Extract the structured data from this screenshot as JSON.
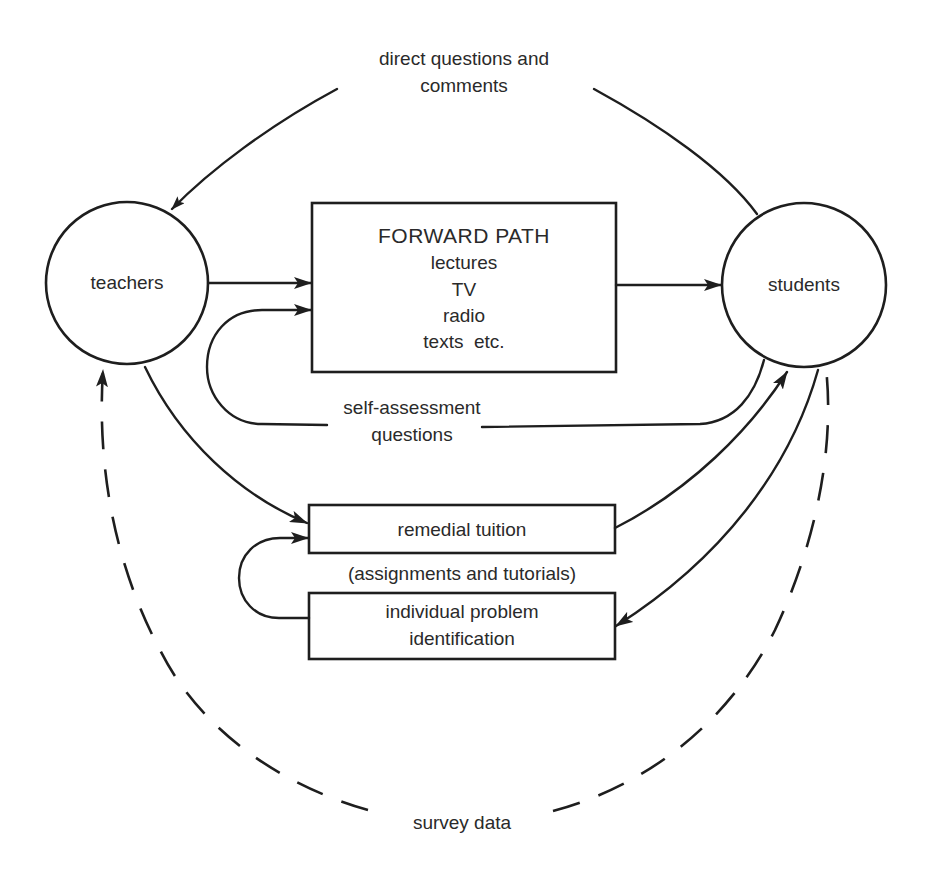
{
  "diagram": {
    "nodes": {
      "teachers": {
        "label": "teachers",
        "shape": "circle"
      },
      "students": {
        "label": "students",
        "shape": "circle"
      },
      "forward_path": {
        "title": "FORWARD PATH",
        "items": [
          "lectures",
          "TV",
          "radio",
          "texts  etc."
        ]
      },
      "remedial_tuition": {
        "label": "remedial tuition"
      },
      "individual_problem": {
        "lines": [
          "individual problem",
          "identification"
        ]
      }
    },
    "edge_labels": {
      "direct_questions": [
        "direct questions and",
        "comments"
      ],
      "self_assessment": [
        "self-assessment",
        "questions"
      ],
      "assignments": "(assignments and tutorials)",
      "survey_data": "survey data"
    },
    "edges": [
      {
        "from": "students",
        "to": "teachers",
        "label": "direct questions and comments",
        "style": "solid"
      },
      {
        "from": "teachers",
        "to": "forward_path",
        "style": "solid"
      },
      {
        "from": "forward_path",
        "to": "students",
        "style": "solid"
      },
      {
        "from": "students",
        "to": "forward_path",
        "label": "self-assessment questions",
        "style": "solid"
      },
      {
        "from": "teachers",
        "to": "remedial_tuition",
        "style": "solid"
      },
      {
        "from": "remedial_tuition",
        "to": "students",
        "style": "solid"
      },
      {
        "from": "students",
        "to": "individual_problem",
        "style": "solid"
      },
      {
        "from": "individual_problem",
        "to": "remedial_tuition",
        "style": "solid"
      },
      {
        "from": "students",
        "to": "teachers",
        "label": "survey data",
        "style": "dashed"
      }
    ],
    "colors": {
      "ink": "#1e1e1e",
      "text": "#2a2a2a",
      "background": "#ffffff"
    }
  }
}
